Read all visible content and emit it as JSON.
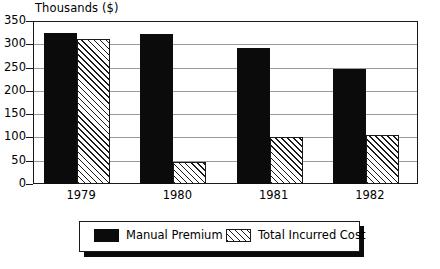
{
  "chart_data": {
    "type": "bar",
    "title": "",
    "ylabel": "Thousands ($)",
    "xlabel": "",
    "categories": [
      "1979",
      "1980",
      "1981",
      "1982"
    ],
    "series": [
      {
        "name": "Manual Premium",
        "values": [
          325,
          322,
          292,
          247
        ],
        "fill": "solid-black",
        "color": "#0b0b0b"
      },
      {
        "name": "Total Incurred Cost",
        "values": [
          312,
          47,
          100,
          105
        ],
        "fill": "diagonal-hatch",
        "color": "#1a1a1a"
      }
    ],
    "ylim": [
      0,
      350
    ],
    "yticks": [
      0,
      50,
      100,
      150,
      200,
      250,
      300,
      350
    ],
    "ytick_labels": [
      "0",
      "50",
      "100",
      "150",
      "200",
      "250",
      "300",
      "350"
    ],
    "grid": true,
    "legend_position": "bottom"
  },
  "legend": {
    "entries": [
      {
        "label": "Manual Premium"
      },
      {
        "label": "Total Incurred Cost"
      }
    ]
  }
}
